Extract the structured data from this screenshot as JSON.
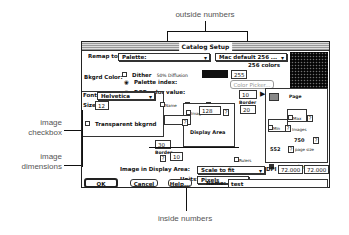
{
  "callouts": {
    "outside_numbers": "outside numbers",
    "image_checkbox_1": "image",
    "image_checkbox_2": "checkbox",
    "image_dimensions_1": "image",
    "image_dimensions_2": "dimensions",
    "inside_numbers": "inside numbers"
  },
  "dialog": {
    "title": "Catalog Setup",
    "remap_label": "Remap to:",
    "remap_value": "Palette:",
    "palette_value": "Mac default 256 ...",
    "dither_label": "Dither",
    "dither_mode": "50% Diffusion",
    "colors_count": "256 colors",
    "bkgrd_label": "Bkgrd Color:",
    "palette_index_label": "Palette index:",
    "palette_index_value": "255",
    "rgb_label": "RGB color value:",
    "color_picker": "Color Picker...",
    "font_label": "Font:",
    "font_value": "Helvetica",
    "size_label": "Size:",
    "size_value": "12",
    "transparent_label": "Transparent bkgrnd",
    "name_chk": "Name",
    "size_chk": "Size",
    "date_chk": "Date/time",
    "outside_top": "10",
    "border_label": "Border",
    "border_right": "20",
    "image_chk": "Image",
    "image_width": "128",
    "image_chk2": "Image",
    "display_area": "Display Area",
    "left_value": "30",
    "border_bottom_label": "Border",
    "bottom_value": "10",
    "rulers": "Rulers",
    "page_label": "Page",
    "max_label": "Max",
    "min_label": "Min",
    "images_label": "Images",
    "page_height": "750",
    "page_width": "552",
    "page_size_label": "page size",
    "for_printer": "For printer",
    "image_in_display_label": "Image in Display Area:",
    "image_in_display_value": "Scale to fit",
    "units_label": "Units:",
    "units_value": "Pixels",
    "dpi_label": "DPI",
    "dpi_x": "72.000",
    "dpi_y": "72.000",
    "ok": "OK",
    "cancel": "Cancel",
    "help": "Help...",
    "name_label": "Name:",
    "name_value": "test",
    "q": "?"
  }
}
